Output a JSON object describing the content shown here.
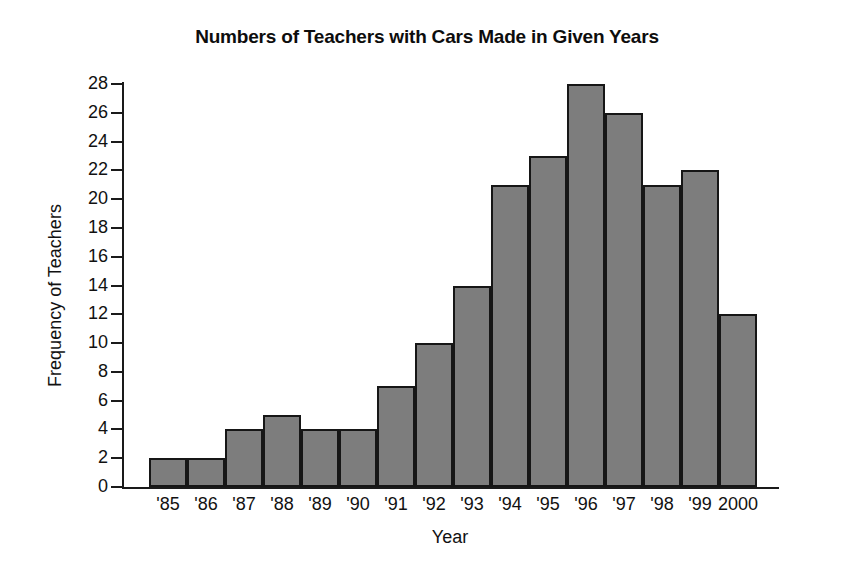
{
  "chart_data": {
    "type": "bar",
    "title": "Numbers of Teachers with Cars Made in Given Years",
    "xlabel": "Year",
    "ylabel": "Frequency of Teachers",
    "categories": [
      "'85",
      "'86",
      "'87",
      "'88",
      "'89",
      "'90",
      "'91",
      "'92",
      "'93",
      "'94",
      "'95",
      "'96",
      "'97",
      "'98",
      "'99",
      "2000"
    ],
    "values": [
      2,
      2,
      4,
      5,
      4,
      4,
      7,
      10,
      14,
      21,
      23,
      28,
      26,
      21,
      22,
      12
    ],
    "ylim": [
      0,
      28
    ],
    "ytick_labels": [
      "0",
      "2",
      "4",
      "6",
      "8",
      "10",
      "12",
      "14",
      "16",
      "18",
      "20",
      "22",
      "24",
      "26",
      "28"
    ],
    "ytick_values": [
      0,
      2,
      4,
      6,
      8,
      10,
      12,
      14,
      16,
      18,
      20,
      22,
      24,
      26,
      28
    ],
    "grid": false,
    "legend": false,
    "bar_fill_color": "#7d7d7d",
    "bar_edge_color": "#161616",
    "axis_color": "#1a1a1a",
    "background_color": "#ffffff",
    "bars_contiguous": true
  }
}
